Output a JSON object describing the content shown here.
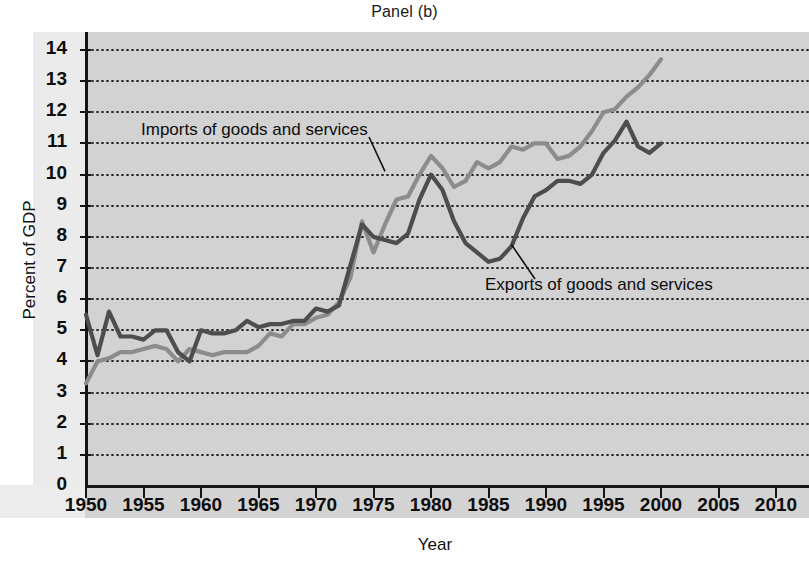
{
  "chart_data": {
    "type": "line",
    "title": "Panel (b)",
    "xlabel": "Year",
    "ylabel": "Percent of GDP",
    "xlim": [
      1950,
      2010
    ],
    "ylim": [
      0,
      14
    ],
    "xticks": [
      1950,
      1955,
      1960,
      1965,
      1970,
      1975,
      1980,
      1985,
      1990,
      1995,
      2000,
      2005,
      2010
    ],
    "yticks": [
      0,
      1,
      2,
      3,
      4,
      5,
      6,
      7,
      8,
      9,
      10,
      11,
      12,
      13,
      14
    ],
    "grid": true,
    "legend_position": "inline-annotations",
    "annotations": [
      {
        "text": "Imports of goods and services",
        "points_to_year": 1976,
        "points_to_value": 10.0
      },
      {
        "text": "Exports of goods and services",
        "points_to_year": 1987,
        "points_to_value": 7.6
      }
    ],
    "series": [
      {
        "name": "Imports of goods and services",
        "color": "#8c8c8c",
        "x": [
          1950,
          1951,
          1952,
          1953,
          1954,
          1955,
          1956,
          1957,
          1958,
          1959,
          1960,
          1961,
          1962,
          1963,
          1964,
          1965,
          1966,
          1967,
          1968,
          1969,
          1970,
          1971,
          1972,
          1973,
          1974,
          1975,
          1976,
          1977,
          1978,
          1979,
          1980,
          1981,
          1982,
          1983,
          1984,
          1985,
          1986,
          1987,
          1988,
          1989,
          1990,
          1991,
          1992,
          1993,
          1994,
          1995,
          1996,
          1997,
          1998,
          1999,
          2000
        ],
        "values": [
          3.3,
          4.0,
          4.1,
          4.3,
          4.3,
          4.4,
          4.5,
          4.4,
          4.0,
          4.4,
          4.3,
          4.2,
          4.3,
          4.3,
          4.3,
          4.5,
          4.9,
          4.8,
          5.2,
          5.2,
          5.4,
          5.5,
          5.9,
          6.7,
          8.5,
          7.5,
          8.4,
          9.2,
          9.3,
          10.0,
          10.6,
          10.2,
          9.6,
          9.8,
          10.4,
          10.2,
          10.4,
          10.9,
          10.8,
          11.0,
          11.0,
          10.5,
          10.6,
          10.9,
          11.4,
          12.0,
          12.1,
          12.5,
          12.8,
          13.2,
          13.7
        ]
      },
      {
        "name": "Exports of goods and services",
        "color": "#4d4d4d",
        "x": [
          1950,
          1951,
          1952,
          1953,
          1954,
          1955,
          1956,
          1957,
          1958,
          1959,
          1960,
          1961,
          1962,
          1963,
          1964,
          1965,
          1966,
          1967,
          1968,
          1969,
          1970,
          1971,
          1972,
          1973,
          1974,
          1975,
          1976,
          1977,
          1978,
          1979,
          1980,
          1981,
          1982,
          1983,
          1984,
          1985,
          1986,
          1987,
          1988,
          1989,
          1990,
          1991,
          1992,
          1993,
          1994,
          1995,
          1996,
          1997,
          1998,
          1999,
          2000
        ],
        "values": [
          5.5,
          4.2,
          5.6,
          4.8,
          4.8,
          4.7,
          5.0,
          5.0,
          4.3,
          4.0,
          5.0,
          4.9,
          4.9,
          5.0,
          5.3,
          5.1,
          5.2,
          5.2,
          5.3,
          5.3,
          5.7,
          5.6,
          5.8,
          7.1,
          8.4,
          8.0,
          7.9,
          7.8,
          8.1,
          9.2,
          10.0,
          9.5,
          8.5,
          7.8,
          7.5,
          7.2,
          7.3,
          7.7,
          8.6,
          9.3,
          9.5,
          9.8,
          9.8,
          9.7,
          10.0,
          10.7,
          11.1,
          11.7,
          10.9,
          10.7,
          11.0
        ]
      }
    ]
  }
}
